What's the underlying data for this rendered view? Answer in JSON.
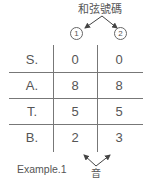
{
  "header": {
    "title": "和弦號碼",
    "markers": [
      "1",
      "2"
    ]
  },
  "table": {
    "rows": [
      {
        "label": "S.",
        "values": [
          "0",
          "0"
        ]
      },
      {
        "label": "A.",
        "values": [
          "8",
          "8"
        ]
      },
      {
        "label": "T.",
        "values": [
          "5",
          "5"
        ]
      },
      {
        "label": "B.",
        "values": [
          "2",
          "3"
        ]
      }
    ]
  },
  "footer": {
    "example_label": "Example.1",
    "note_label": "音"
  }
}
